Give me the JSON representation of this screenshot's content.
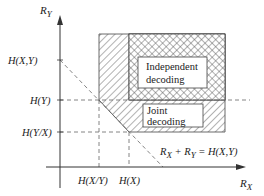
{
  "diagram": {
    "type": "rate-region",
    "axes": {
      "x_label": "R",
      "x_sub": "X",
      "y_label": "R",
      "y_sub": "Y"
    },
    "y_ticks": [
      {
        "label": "H(X,Y)"
      },
      {
        "label": "H(Y)"
      },
      {
        "label": "H(Y/X)"
      }
    ],
    "x_ticks": [
      {
        "label": "H(X/Y)"
      },
      {
        "label": "H(X)"
      }
    ],
    "regions": {
      "independent": {
        "line1": "Independent",
        "line2": "decoding",
        "pattern": "crosshatch"
      },
      "joint": {
        "line1": "Joint",
        "line2": "decoding",
        "pattern": "diagonal-hatch"
      }
    },
    "equation": {
      "r1": "R",
      "s1": "X",
      "plus": " + ",
      "r2": "R",
      "s2": "Y",
      "rhs": " = H(X,Y)"
    },
    "colors": {
      "line": "#333333",
      "dashed": "#666666",
      "hatch": "#555555"
    }
  }
}
